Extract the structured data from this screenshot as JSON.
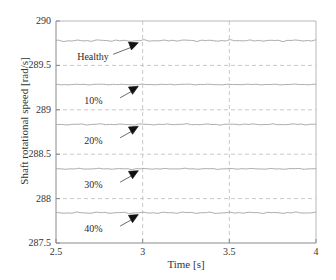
{
  "chart_data": {
    "type": "line",
    "title": "",
    "xlabel": "Time [s]",
    "ylabel": "Shaft rotational speed [rad/s]",
    "xlim": [
      2.5,
      4
    ],
    "ylim": [
      287.5,
      290
    ],
    "xticks": [
      "2.5",
      "3",
      "3.5",
      "4"
    ],
    "xtick_values": [
      2.5,
      3,
      3.5,
      4
    ],
    "yticks": [
      "290",
      "289.5",
      "289",
      "288.5",
      "288",
      "287.5"
    ],
    "ytick_values": [
      290,
      289.5,
      289,
      288.5,
      288,
      287.5
    ],
    "grid": true,
    "grid_style": "dashed",
    "legend": "none",
    "line_color": "#9aa0a6",
    "series": [
      {
        "name": "Healthy",
        "mean": 289.78,
        "ripple": 0.012,
        "values": [
          289.782,
          289.771,
          289.784,
          289.773,
          289.786,
          289.775,
          289.783,
          289.772,
          289.785,
          289.774,
          289.783,
          289.776,
          289.786,
          289.774,
          289.784,
          289.773,
          289.785,
          289.776,
          289.783,
          289.775,
          289.784,
          289.773,
          289.786,
          289.775,
          289.784
        ]
      },
      {
        "name": "10%",
        "mean": 289.285,
        "ripple": 0.006,
        "values": [
          289.286,
          289.281,
          289.288,
          289.282,
          289.289,
          289.283,
          289.287,
          289.281,
          289.288,
          289.282,
          289.287,
          289.283,
          289.289,
          289.282,
          289.288,
          289.281,
          289.287,
          289.283,
          289.288,
          289.282,
          289.287,
          289.282,
          289.289,
          289.283,
          289.287
        ]
      },
      {
        "name": "20%",
        "mean": 288.835,
        "ripple": 0.008,
        "values": [
          288.838,
          288.83,
          288.84,
          288.831,
          288.841,
          288.832,
          288.839,
          288.83,
          288.84,
          288.831,
          288.839,
          288.833,
          288.841,
          288.831,
          288.84,
          288.83,
          288.839,
          288.833,
          288.84,
          288.832,
          288.839,
          288.831,
          288.841,
          288.832,
          288.839
        ]
      },
      {
        "name": "30%",
        "mean": 288.335,
        "ripple": 0.007,
        "values": [
          288.337,
          288.331,
          288.339,
          288.332,
          288.34,
          288.332,
          288.338,
          288.331,
          288.339,
          288.332,
          288.338,
          288.333,
          288.34,
          288.331,
          288.339,
          288.331,
          288.338,
          288.333,
          288.339,
          288.332,
          288.338,
          288.331,
          288.34,
          288.332,
          288.338
        ]
      },
      {
        "name": "40%",
        "mean": 287.84,
        "ripple": 0.01,
        "values": [
          287.843,
          287.834,
          287.846,
          287.835,
          287.847,
          287.836,
          287.845,
          287.834,
          287.846,
          287.835,
          287.845,
          287.837,
          287.847,
          287.835,
          287.846,
          287.834,
          287.845,
          287.837,
          287.846,
          287.836,
          287.845,
          287.835,
          287.847,
          287.836,
          287.845
        ]
      }
    ],
    "annotations": [
      {
        "label": "Healthy",
        "label_x": 2.68,
        "label_y": 289.58,
        "tip_x": 2.975,
        "tip_y": 289.755
      },
      {
        "label": "10%",
        "label_x": 2.72,
        "label_y": 289.09,
        "tip_x": 2.975,
        "tip_y": 289.265
      },
      {
        "label": "20%",
        "label_x": 2.72,
        "label_y": 288.64,
        "tip_x": 2.975,
        "tip_y": 288.815
      },
      {
        "label": "30%",
        "label_x": 2.72,
        "label_y": 288.14,
        "tip_x": 2.975,
        "tip_y": 288.315
      },
      {
        "label": "40%",
        "label_x": 2.72,
        "label_y": 287.645,
        "tip_x": 2.975,
        "tip_y": 287.82
      }
    ]
  }
}
